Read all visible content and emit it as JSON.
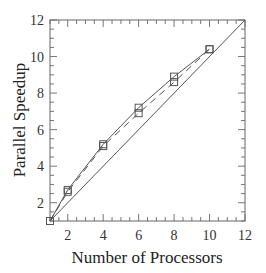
{
  "chart_data": {
    "type": "line",
    "title": "",
    "xlabel": "Number of Processors",
    "ylabel": "Parallel Speedup",
    "xlim": [
      1,
      12
    ],
    "ylim": [
      1,
      12
    ],
    "xticks": [
      2,
      4,
      6,
      8,
      10,
      12
    ],
    "yticks": [
      2,
      4,
      6,
      8,
      10,
      12
    ],
    "grid": false,
    "legend": null,
    "series": [
      {
        "name": "Series A (solid)",
        "style": "solid",
        "marker": "square",
        "x": [
          1,
          2,
          4,
          6,
          8,
          10
        ],
        "values": [
          1.0,
          2.7,
          5.2,
          7.2,
          8.9,
          10.4
        ]
      },
      {
        "name": "Series B (dashed)",
        "style": "dashed",
        "marker": "square",
        "x": [
          1,
          2,
          4,
          6,
          8,
          10
        ],
        "values": [
          1.0,
          2.6,
          5.1,
          6.9,
          8.6,
          10.4
        ]
      },
      {
        "name": "Ideal linear speedup",
        "style": "solid",
        "marker": "none",
        "x": [
          1,
          12
        ],
        "values": [
          1,
          12
        ]
      }
    ]
  },
  "colors": {
    "axis": "#555555",
    "line": "#555555",
    "text": "#333333"
  }
}
